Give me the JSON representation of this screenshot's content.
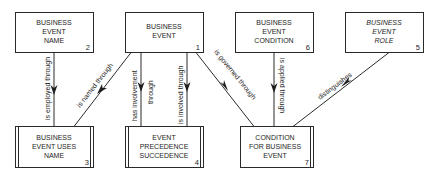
{
  "diagram": {
    "type": "entity-relationship",
    "entities": [
      {
        "id": "2",
        "lines": [
          "BUSINESS",
          "EVENT",
          "NAME"
        ],
        "number": "2",
        "italic": false,
        "kind": "independent"
      },
      {
        "id": "1",
        "lines": [
          "BUSINESS",
          "EVENT"
        ],
        "number": "1",
        "italic": false,
        "kind": "independent"
      },
      {
        "id": "6",
        "lines": [
          "BUSINESS",
          "EVENT",
          "CONDITION"
        ],
        "number": "6",
        "italic": false,
        "kind": "independent"
      },
      {
        "id": "5",
        "lines": [
          "BUSINESS",
          "EVENT",
          "ROLE"
        ],
        "number": "5",
        "italic": true,
        "kind": "independent"
      },
      {
        "id": "3",
        "lines": [
          "BUSINESS",
          "EVENT USES",
          "NAME"
        ],
        "number": "3",
        "italic": false,
        "kind": "associative"
      },
      {
        "id": "4",
        "lines": [
          "EVENT",
          "PRECEDENCE",
          "SUCCEDENCE"
        ],
        "number": "4",
        "italic": false,
        "kind": "associative"
      },
      {
        "id": "7",
        "lines": [
          "CONDITION",
          "FOR BUSINESS",
          "EVENT"
        ],
        "number": "7",
        "italic": false,
        "kind": "associative"
      }
    ],
    "relationships": [
      {
        "from": "2",
        "to": "3",
        "label": "is employed through"
      },
      {
        "from": "1",
        "to": "3",
        "label": "is named through"
      },
      {
        "from": "1",
        "to": "4",
        "label_lines": [
          "has involvement",
          "through"
        ]
      },
      {
        "from": "1",
        "to": "4",
        "label": "is involved through"
      },
      {
        "from": "1",
        "to": "7",
        "label": "is governed through"
      },
      {
        "from": "6",
        "to": "7",
        "label": "is applied through"
      },
      {
        "from": "5",
        "to": "7",
        "label": "distinguishes"
      }
    ]
  }
}
